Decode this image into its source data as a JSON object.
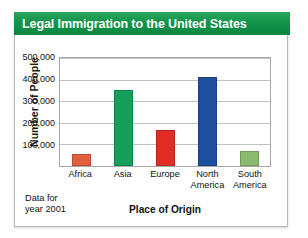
{
  "banner": {
    "title": "Legal Immigration to the United States",
    "background_color": "#12934a",
    "text_color": "#ffffff"
  },
  "footnote": {
    "line1": "Data for",
    "line2": "year 2001"
  },
  "chart_data": {
    "type": "bar",
    "title": "Legal Immigration to the United States",
    "xlabel": "Place of Origin",
    "ylabel": "Number of People",
    "categories": [
      "Africa",
      "Asia",
      "Europe",
      "North America",
      "South America"
    ],
    "category_lines": [
      [
        "Africa"
      ],
      [
        "Asia"
      ],
      [
        "Europe"
      ],
      [
        "North",
        "America"
      ],
      [
        "South",
        "America"
      ]
    ],
    "values": [
      55000,
      350000,
      165000,
      410000,
      70000
    ],
    "bar_colors": [
      "#e2613c",
      "#14a05a",
      "#e02d25",
      "#1d4f9e",
      "#8cba6e"
    ],
    "ylim": [
      0,
      500000
    ],
    "yticks": [
      100000,
      200000,
      300000,
      400000,
      500000
    ],
    "ytick_labels": [
      "100,000",
      "200,000",
      "300,000",
      "400,000",
      "500,000"
    ],
    "grid": true,
    "legend": false,
    "annotation": "Data for year 2001"
  }
}
